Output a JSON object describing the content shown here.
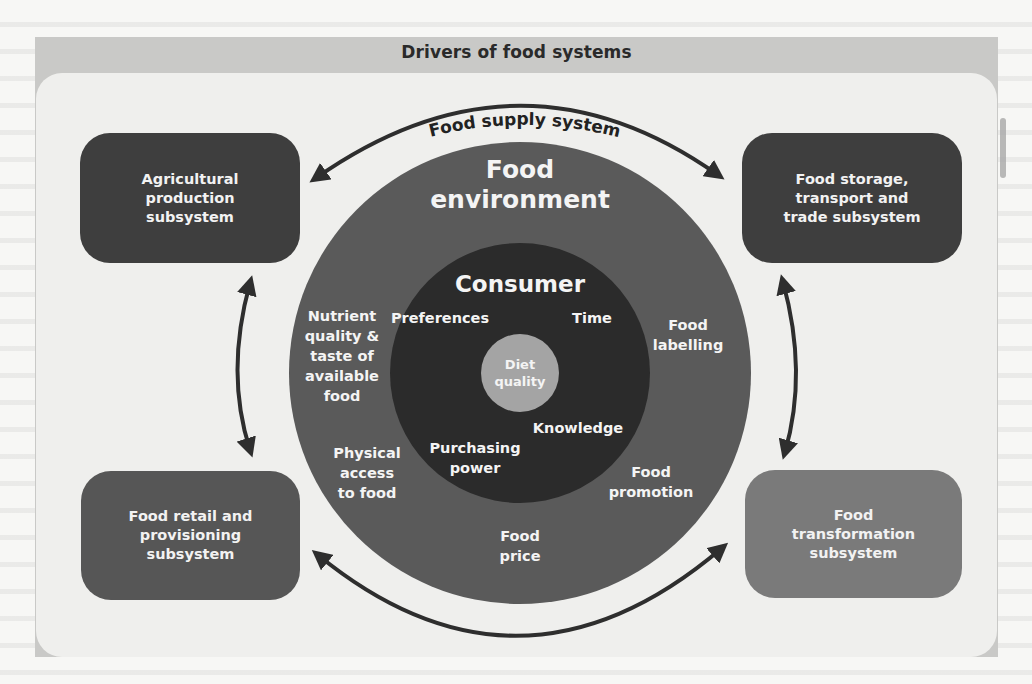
{
  "title": "Drivers of food systems",
  "arc_label": "Food supply system",
  "colors": {
    "frame": "#c9c9c7",
    "panel": "#efefed",
    "outer_ring": "#5a5a5a",
    "inner_circle": "#2b2b2b",
    "diet_circle": "#a4a4a4",
    "box_dark": "#3e3e3e",
    "box_mid": "#565656",
    "box_light": "#7a7a7a",
    "arrow": "#2e2e2e",
    "label_text": "#f4f4f4"
  },
  "subsystems": {
    "top_left": "Agricultural\nproduction\nsubsystem",
    "top_right": "Food storage,\ntransport and\ntrade subsystem",
    "bottom_left": "Food retail and\nprovisioning\nsubsystem",
    "bottom_right": "Food\ntransformation\nsubsystem"
  },
  "food_environment": {
    "title": "Food\nenvironment",
    "factors": {
      "nutrient_quality": "Nutrient\nquality &\ntaste of\navailable\nfood",
      "food_labelling": "Food\nlabelling",
      "physical_access": "Physical\naccess\nto food",
      "food_promotion": "Food\npromotion",
      "food_price": "Food\nprice"
    }
  },
  "consumer": {
    "title": "Consumer",
    "factors": {
      "preferences": "Preferences",
      "time": "Time",
      "knowledge": "Knowledge",
      "purchasing_power": "Purchasing\npower"
    }
  },
  "core": "Diet\nquality"
}
